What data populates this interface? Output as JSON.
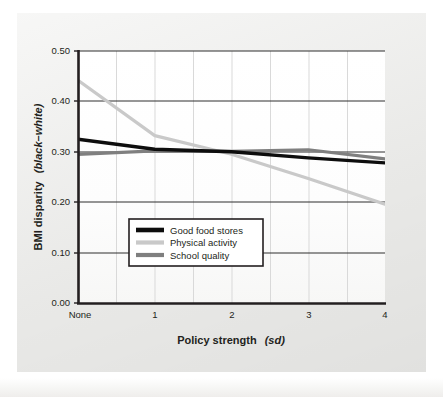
{
  "chart_data": {
    "type": "line",
    "title": "",
    "xlabel": "Policy strength (sd)",
    "xlabel_main": "Policy strength",
    "xlabel_italic": "(sd)",
    "ylabel": "BMI disparity (black–white)",
    "ylabel_main": "BMI disparity",
    "ylabel_italic": "(black–white)",
    "x": [
      0,
      1,
      2,
      3,
      4
    ],
    "xtick_labels": [
      "None",
      "1",
      "2",
      "3",
      "4"
    ],
    "ytick_labels": [
      "0.00",
      "0.10",
      "0.20",
      "0.30",
      "0.40",
      "0.50"
    ],
    "ytick_values": [
      0.0,
      0.1,
      0.2,
      0.3,
      0.4,
      0.5
    ],
    "xlim": [
      0,
      4
    ],
    "ylim": [
      0.0,
      0.5
    ],
    "grid": "horizontal-and-vertical",
    "gridline_x_minor": [
      0.5,
      1.5,
      2.5,
      3.5
    ],
    "legend_position": "lower-left-inside",
    "series": [
      {
        "name": "Good food stores",
        "color": "#0d0d0d",
        "width": 3.4,
        "values": [
          0.325,
          0.305,
          0.3,
          0.288,
          0.278
        ]
      },
      {
        "name": "Physical activity",
        "color": "#c9c9c9",
        "width": 3.2,
        "values": [
          0.442,
          0.332,
          0.295,
          0.247,
          0.196
        ]
      },
      {
        "name": "School quality",
        "color": "#7f7f7f",
        "width": 3.2,
        "values": [
          0.295,
          0.302,
          0.301,
          0.304,
          0.286
        ]
      }
    ]
  },
  "legend": {
    "items": [
      {
        "label": "Good food stores",
        "color": "#0d0d0d"
      },
      {
        "label": "Physical activity",
        "color": "#c9c9c9"
      },
      {
        "label": "School quality",
        "color": "#7f7f7f"
      }
    ]
  },
  "colors": {
    "axis": "#231f20",
    "grid": "#3a3a3a",
    "panel_bg": "#ededeb",
    "plot_bg": "#ffffff",
    "text": "#231f20"
  }
}
